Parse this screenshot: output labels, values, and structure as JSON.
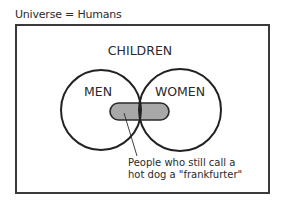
{
  "title": "Universe = Humans",
  "sets": {
    "outer": "CHILDREN",
    "left": "MEN",
    "right": "WOMEN"
  },
  "annotation": {
    "line1": "People who still call a",
    "line2": "hot dog a \"frankfurter\""
  },
  "colors": {
    "stroke": "#2a2a2a",
    "highlight_fill": "#a8a8a8"
  }
}
